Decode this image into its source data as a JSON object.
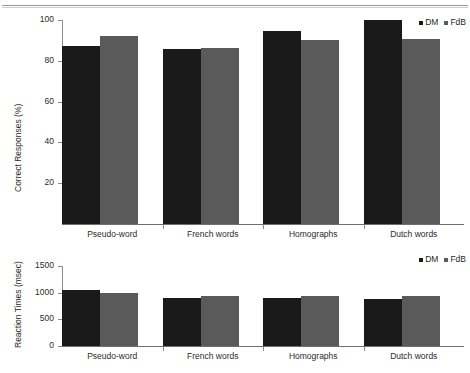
{
  "chart_data": [
    {
      "type": "bar",
      "panel": "top",
      "title": "",
      "xlabel": "",
      "ylabel": "Correct Responses (%)",
      "ylim": [
        0,
        100
      ],
      "yticks": [
        0,
        20,
        40,
        60,
        80,
        100
      ],
      "grid": false,
      "legend_position": "top-right",
      "categories": [
        "Pseudo-word",
        "French words",
        "Homographs",
        "Dutch words"
      ],
      "series": [
        {
          "name": "DM",
          "color": "#1a1a1a",
          "values": [
            87.5,
            86.0,
            94.5,
            100.0
          ]
        },
        {
          "name": "FdB",
          "color": "#5a5a5a",
          "values": [
            92.0,
            86.5,
            90.0,
            90.5
          ]
        }
      ]
    },
    {
      "type": "bar",
      "panel": "bottom",
      "title": "",
      "xlabel": "",
      "ylabel": "Reaction Times (msec)",
      "ylim": [
        0,
        1500
      ],
      "yticks": [
        0,
        500,
        1000,
        1500
      ],
      "grid": false,
      "legend_position": "top-right",
      "categories": [
        "Pseudo-word",
        "French words",
        "Homographs",
        "Dutch words"
      ],
      "series": [
        {
          "name": "DM",
          "color": "#1a1a1a",
          "values": [
            1050,
            900,
            900,
            880
          ]
        },
        {
          "name": "FdB",
          "color": "#5a5a5a",
          "values": [
            990,
            930,
            930,
            940
          ]
        }
      ]
    }
  ],
  "top_chart": {
    "y_axis_title": "Correct Responses (%)",
    "y_tick_labels": [
      "100",
      "80",
      "60",
      "40",
      "20"
    ],
    "category_labels": [
      "Pseudo-word",
      "French words",
      "Homographs",
      "Dutch words"
    ],
    "legend": {
      "dm_label": "DM",
      "fdb_label": "FdB"
    }
  },
  "bottom_chart": {
    "y_axis_title": "Reaction Times (msec)",
    "y_tick_labels": [
      "1500",
      "1000",
      "500",
      "0"
    ],
    "category_labels": [
      "Pseudo-word",
      "French words",
      "Homographs",
      "Dutch words"
    ],
    "legend": {
      "dm_label": "DM",
      "fdb_label": "FdB"
    }
  }
}
